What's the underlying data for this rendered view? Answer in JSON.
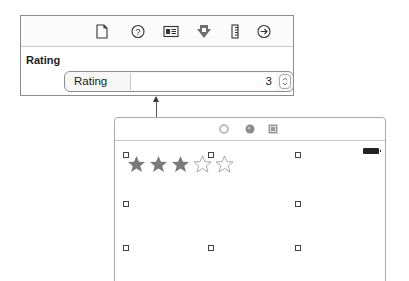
{
  "inspector": {
    "toolbar": {
      "icons": [
        {
          "name": "file-inspector-icon"
        },
        {
          "name": "quick-help-icon"
        },
        {
          "name": "identity-inspector-icon"
        },
        {
          "name": "attributes-inspector-icon"
        },
        {
          "name": "size-inspector-icon"
        },
        {
          "name": "connections-inspector-icon"
        }
      ]
    },
    "section_title": "Rating",
    "rating_field": {
      "label": "Rating",
      "value": "3"
    }
  },
  "canvas": {
    "header_icons": [
      {
        "name": "view-controller-icon"
      },
      {
        "name": "first-responder-icon"
      },
      {
        "name": "exit-icon"
      }
    ],
    "rating_control": {
      "filled_stars": 3,
      "total_stars": 5,
      "star_color": "#7a7a7a"
    }
  },
  "colors": {
    "panel_border": "#8c8c8c",
    "divider": "#c8c8c8",
    "connector": "#555555"
  }
}
